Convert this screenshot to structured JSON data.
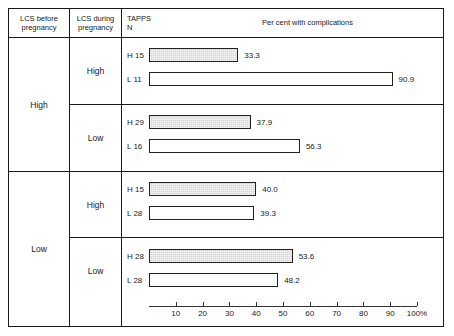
{
  "table": {
    "columns": [
      {
        "id": "lcs-before",
        "label": "LCS before\npregnancy",
        "line1": "LCS before",
        "line2": "pregnancy"
      },
      {
        "id": "lcs-during",
        "label": "LCS during\npregnancy",
        "line1": "LCS during",
        "line2": "pregnancy"
      },
      {
        "id": "tapps-n",
        "line1": "TAPPS",
        "line2": "N"
      },
      {
        "id": "chart",
        "title": "Per cent with complications"
      }
    ],
    "major_groups": [
      {
        "label": "High"
      },
      {
        "label": "Low"
      }
    ],
    "sub_groups": [
      {
        "label": "High"
      },
      {
        "label": "Low"
      },
      {
        "label": "High"
      },
      {
        "label": "Low"
      }
    ]
  },
  "chart_data": {
    "type": "bar",
    "orientation": "horizontal",
    "title": "Per cent with complications",
    "xlabel": "",
    "ylabel": "",
    "xlim": [
      0,
      100
    ],
    "xunit": "%",
    "grid": false,
    "legend": null,
    "ticks": [
      {
        "value": 10,
        "label": "10"
      },
      {
        "value": 20,
        "label": "20"
      },
      {
        "value": 30,
        "label": "30"
      },
      {
        "value": 40,
        "label": "40"
      },
      {
        "value": 50,
        "label": "50"
      },
      {
        "value": 60,
        "label": "60"
      },
      {
        "value": 70,
        "label": "70"
      },
      {
        "value": 80,
        "label": "80"
      },
      {
        "value": 90,
        "label": "90"
      },
      {
        "value": 100,
        "label": "100%"
      }
    ],
    "bars": [
      {
        "group": "High",
        "subgroup": "High",
        "n_label": "H 15",
        "value": 33.3,
        "value_label": "33.3",
        "style": "shaded"
      },
      {
        "group": "High",
        "subgroup": "High",
        "n_label": "L 11",
        "value": 90.9,
        "value_label": "90.9",
        "style": "open"
      },
      {
        "group": "High",
        "subgroup": "Low",
        "n_label": "H 29",
        "value": 37.9,
        "value_label": "37.9",
        "style": "shaded"
      },
      {
        "group": "High",
        "subgroup": "Low",
        "n_label": "L 16",
        "value": 56.3,
        "value_label": "56.3",
        "style": "open"
      },
      {
        "group": "Low",
        "subgroup": "High",
        "n_label": "H 15",
        "value": 40.0,
        "value_label": "40.0",
        "style": "shaded"
      },
      {
        "group": "Low",
        "subgroup": "High",
        "n_label": "L 28",
        "value": 39.3,
        "value_label": "39.3",
        "style": "open"
      },
      {
        "group": "Low",
        "subgroup": "Low",
        "n_label": "H 28",
        "value": 53.6,
        "value_label": "53.6",
        "style": "shaded"
      },
      {
        "group": "Low",
        "subgroup": "Low",
        "n_label": "L 28",
        "value": 48.2,
        "value_label": "48.2",
        "style": "open"
      }
    ]
  },
  "colors": {
    "rule": "#1a1a1a",
    "bar_outline": "#222222",
    "bar_shaded_fill": "#d2d2d2",
    "bar_open_fill": "#ffffff",
    "text": "#1a1a1a",
    "background": "#ffffff"
  }
}
